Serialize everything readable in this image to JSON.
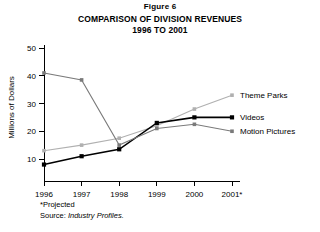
{
  "figure": {
    "label": "Figure 6",
    "title_line1": "COMPARISON OF DIVISION REVENUES",
    "title_line2": "1996 TO 2001"
  },
  "footnotes": {
    "projected": "*Projected",
    "source_prefix": "Source: ",
    "source_name": "Industry Profiles."
  },
  "chart_data": {
    "type": "line",
    "title": "COMPARISON OF DIVISION REVENUES 1996 TO 2001",
    "xlabel": "",
    "ylabel": "Millions of Dollars",
    "categories": [
      "1996",
      "1997",
      "1998",
      "1999",
      "2000",
      "2001*"
    ],
    "yticks": [
      10,
      20,
      30,
      40,
      50
    ],
    "ylim": [
      5,
      50
    ],
    "grid": false,
    "legend_position": "inline-right",
    "series": [
      {
        "name": "Theme Parks",
        "color": "#b0b0b0",
        "marker": "square",
        "values": [
          13,
          15,
          17.5,
          22,
          28,
          33
        ]
      },
      {
        "name": "Videos",
        "color": "#000000",
        "marker": "square",
        "values": [
          8,
          11,
          13.5,
          23,
          25,
          25
        ]
      },
      {
        "name": "Motion Pictures",
        "color": "#7a7a7a",
        "marker": "square",
        "values": [
          41,
          38.5,
          15,
          21,
          22.5,
          20
        ]
      }
    ]
  }
}
